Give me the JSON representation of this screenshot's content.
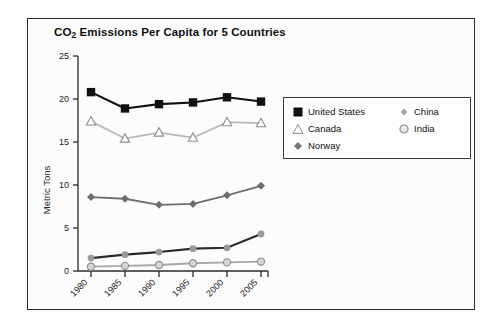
{
  "chart_data": {
    "type": "line",
    "title": "CO2 Emissions Per Capita for 5 Countries",
    "title_main": "CO",
    "title_sub": "2",
    "title_rest": " Emissions Per Capita for 5 Countries",
    "xlabel": "",
    "ylabel": "Metric Tons",
    "categories": [
      "1980",
      "1985",
      "1990",
      "1995",
      "2000",
      "2005"
    ],
    "x": [
      1980,
      1985,
      1990,
      1995,
      2000,
      2005
    ],
    "ylim": [
      0,
      25
    ],
    "yticks": [
      "0",
      "5",
      "10",
      "15",
      "20",
      "25"
    ],
    "ytick_values": [
      0,
      5,
      10,
      15,
      20,
      25
    ],
    "grid": false,
    "legend_position": "inside-right",
    "series": [
      {
        "name": "United States",
        "marker": "filled-square",
        "color": "#111111",
        "values": [
          20.8,
          18.9,
          19.4,
          19.6,
          20.2,
          19.7
        ]
      },
      {
        "name": "Canada",
        "marker": "open-triangle",
        "color": "#b9b9b9",
        "values": [
          17.4,
          15.4,
          16.1,
          15.5,
          17.3,
          17.2
        ]
      },
      {
        "name": "Norway",
        "marker": "diamond",
        "color": "#6e6e6e",
        "values": [
          8.6,
          8.4,
          7.7,
          7.8,
          8.8,
          9.9
        ]
      },
      {
        "name": "China",
        "marker": "small-diamond",
        "color": "#2b2b2b",
        "values": [
          1.5,
          1.9,
          2.2,
          2.6,
          2.7,
          4.3
        ]
      },
      {
        "name": "India",
        "marker": "open-circle",
        "color": "#a8a8a8",
        "values": [
          0.5,
          0.6,
          0.7,
          0.9,
          1.0,
          1.1
        ]
      }
    ]
  },
  "legend": {
    "left_column": [
      {
        "label": "United States",
        "marker": "filled-square"
      },
      {
        "label": "Canada",
        "marker": "open-triangle"
      },
      {
        "label": "Norway",
        "marker": "diamond"
      }
    ],
    "right_column": [
      {
        "label": "China",
        "marker": "small-diamond"
      },
      {
        "label": "India",
        "marker": "open-circle"
      }
    ]
  },
  "colors": {
    "united_states": "#111111",
    "canada": "#b9b9b9",
    "norway": "#6e6e6e",
    "china": "#2b2b2b",
    "india": "#a8a8a8",
    "axis": "#2b2b2b",
    "frame": "#2b2b2b",
    "background": "#fdfdfd"
  }
}
